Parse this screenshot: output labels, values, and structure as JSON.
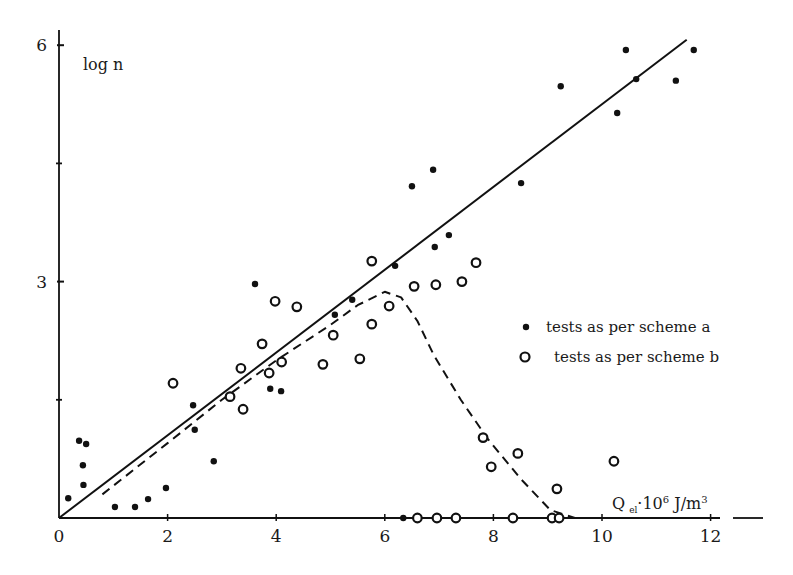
{
  "chart_data": {
    "type": "scatter",
    "title": "",
    "xlabel": "Q el · 10^6 J/m^3",
    "xlabel_parts": {
      "main": "Q",
      "sub": "el",
      "mid": "·10",
      "sup1": "6",
      "unit": " J/m",
      "sup2": "3"
    },
    "ylabel": "log n",
    "xlim": [
      0,
      13
    ],
    "ylim": [
      0,
      6.2
    ],
    "x_ticks": [
      0,
      2,
      4,
      6,
      8,
      10,
      12
    ],
    "y_ticks": [
      3,
      6
    ],
    "y_minor_ticks": [
      1.5,
      4.5
    ],
    "grid": false,
    "legend_position": "right-middle",
    "legend": [
      {
        "marker": "filled-dot",
        "label": "tests as per scheme a"
      },
      {
        "marker": "open-circle",
        "label": "tests as per scheme b"
      }
    ],
    "series": [
      {
        "name": "tests as per scheme a",
        "marker": "filled-dot",
        "points": [
          [
            0.17,
            0.25
          ],
          [
            0.37,
            0.98
          ],
          [
            0.5,
            0.94
          ],
          [
            0.44,
            0.67
          ],
          [
            0.45,
            0.42
          ],
          [
            1.03,
            0.14
          ],
          [
            1.4,
            0.14
          ],
          [
            1.64,
            0.24
          ],
          [
            1.97,
            0.38
          ],
          [
            2.47,
            1.43
          ],
          [
            2.5,
            1.12
          ],
          [
            2.85,
            0.72
          ],
          [
            3.61,
            2.97
          ],
          [
            3.89,
            1.64
          ],
          [
            4.09,
            1.61
          ],
          [
            4.1,
            1.96
          ],
          [
            5.08,
            2.58
          ],
          [
            5.4,
            2.77
          ],
          [
            6.19,
            3.2
          ],
          [
            6.34,
            0.0
          ],
          [
            6.5,
            4.21
          ],
          [
            6.89,
            4.42
          ],
          [
            6.92,
            3.44
          ],
          [
            7.18,
            3.59
          ],
          [
            8.51,
            4.25
          ],
          [
            9.24,
            5.48
          ],
          [
            10.28,
            5.14
          ],
          [
            10.44,
            5.94
          ],
          [
            10.63,
            5.57
          ],
          [
            11.36,
            5.55
          ],
          [
            11.69,
            5.94
          ]
        ]
      },
      {
        "name": "tests as per scheme b",
        "marker": "open-circle",
        "points": [
          [
            2.1,
            1.71
          ],
          [
            3.15,
            1.54
          ],
          [
            3.35,
            1.9
          ],
          [
            3.39,
            1.38
          ],
          [
            3.74,
            2.21
          ],
          [
            3.87,
            1.84
          ],
          [
            3.98,
            2.75
          ],
          [
            4.1,
            1.98
          ],
          [
            4.38,
            2.68
          ],
          [
            4.86,
            1.95
          ],
          [
            5.05,
            2.32
          ],
          [
            5.54,
            2.02
          ],
          [
            5.76,
            2.46
          ],
          [
            5.76,
            3.26
          ],
          [
            6.08,
            2.69
          ],
          [
            6.54,
            2.94
          ],
          [
            6.94,
            2.96
          ],
          [
            7.42,
            3.0
          ],
          [
            7.68,
            3.24
          ],
          [
            7.81,
            1.02
          ],
          [
            7.96,
            0.65
          ],
          [
            8.45,
            0.82
          ],
          [
            9.17,
            0.37
          ],
          [
            10.22,
            0.72
          ],
          [
            6.6,
            0.0
          ],
          [
            6.96,
            0.0
          ],
          [
            7.31,
            0.0
          ],
          [
            8.36,
            0.0
          ],
          [
            9.08,
            0.0
          ],
          [
            9.21,
            0.0
          ]
        ]
      }
    ],
    "lines": [
      {
        "name": "regression scheme a",
        "style": "solid",
        "points": [
          [
            0,
            0
          ],
          [
            11.56,
            6.07
          ]
        ]
      },
      {
        "name": "trend scheme b",
        "style": "dashed",
        "points": [
          [
            0.8,
            0.3
          ],
          [
            2.0,
            0.95
          ],
          [
            3.0,
            1.5
          ],
          [
            4.0,
            2.0
          ],
          [
            5.0,
            2.45
          ],
          [
            5.5,
            2.7
          ],
          [
            6.0,
            2.87
          ],
          [
            6.3,
            2.8
          ],
          [
            6.6,
            2.5
          ],
          [
            6.9,
            2.07
          ],
          [
            7.4,
            1.5
          ],
          [
            7.9,
            1.0
          ],
          [
            8.5,
            0.5
          ],
          [
            9.05,
            0.1
          ],
          [
            9.5,
            0.0
          ]
        ]
      }
    ]
  },
  "layout": {
    "origin_px": [
      59,
      518
    ],
    "px_per_x": 54.3,
    "px_per_y": 78.8,
    "x_axis_end_px": 763,
    "x_axis_break_px": [
      720,
      733
    ],
    "y_axis_top_px": 30
  }
}
